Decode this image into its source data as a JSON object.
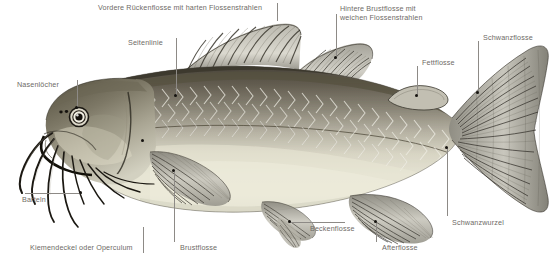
{
  "diagram": {
    "language": "de",
    "background_color": "#ffffff",
    "label_color": "#6e6a66",
    "leader_color": "#8d8a86",
    "dot_color": "#15130f"
  },
  "labels": [
    {
      "id": "vordere-rueckenflosse",
      "text": "Vordere Rückenflosse mit harten Flossenstrahlen",
      "x": 98,
      "y": 3,
      "lines": [
        {
          "type": "v",
          "x": 277,
          "y": 3,
          "len": 18
        }
      ],
      "dot": null
    },
    {
      "id": "seitenlinie",
      "text": "Seitenlinie",
      "x": 128,
      "y": 38,
      "lines": [
        {
          "type": "v",
          "x": 176,
          "y": 38,
          "len": 57
        }
      ],
      "dot": {
        "x": 175,
        "y": 95
      }
    },
    {
      "id": "nasenloecher",
      "text": "Nasenlöcher",
      "x": 17,
      "y": 80,
      "lines": [
        {
          "type": "v",
          "x": 77,
          "y": 80,
          "len": 27
        }
      ],
      "dot": {
        "x": 76,
        "y": 107
      }
    },
    {
      "id": "hintere-brustflosse",
      "text": "Hintere Brustflosse mit\nweichen Flossenstrahlen",
      "x": 340,
      "y": 4,
      "lines": [
        {
          "type": "v",
          "x": 336,
          "y": 14,
          "len": 43
        }
      ],
      "dot": {
        "x": 335,
        "y": 57
      }
    },
    {
      "id": "fettflosse",
      "text": "Fettflosse",
      "x": 422,
      "y": 58,
      "lines": [
        {
          "type": "v",
          "x": 417,
          "y": 66,
          "len": 29
        }
      ],
      "dot": {
        "x": 416,
        "y": 95
      }
    },
    {
      "id": "schwanzflosse",
      "text": "Schwanzflosse",
      "x": 483,
      "y": 33,
      "lines": [
        {
          "type": "v",
          "x": 478,
          "y": 41,
          "len": 51
        }
      ],
      "dot": {
        "x": 477,
        "y": 92
      }
    },
    {
      "id": "barteln",
      "text": "Barteln",
      "x": 22,
      "y": 195,
      "lines": [
        {
          "type": "h",
          "x": 25,
          "y": 193,
          "len": 57
        }
      ],
      "dot": {
        "x": 80,
        "y": 192
      }
    },
    {
      "id": "kiemendeckel",
      "text": "Kiemendeckel oder Operculum",
      "x": 30,
      "y": 243,
      "lines": [
        {
          "type": "v",
          "x": 143,
          "y": 227,
          "len": 26
        }
      ],
      "dot": {
        "x": 142,
        "y": 140
      }
    },
    {
      "id": "brustflosse",
      "text": "Brustflosse",
      "x": 180,
      "y": 243,
      "lines": [
        {
          "type": "v",
          "x": 174,
          "y": 172,
          "len": 70
        }
      ],
      "dot": {
        "x": 173,
        "y": 170
      }
    },
    {
      "id": "beckenflosse",
      "text": "Beckenflosse",
      "x": 310,
      "y": 224,
      "lines": [
        {
          "type": "h",
          "x": 290,
          "y": 222,
          "len": 55
        }
      ],
      "dot": {
        "x": 289,
        "y": 221
      }
    },
    {
      "id": "afterflosse",
      "text": "Afterflosse",
      "x": 382,
      "y": 243,
      "lines": [
        {
          "type": "v",
          "x": 376,
          "y": 222,
          "len": 20
        }
      ],
      "dot": {
        "x": 375,
        "y": 221
      }
    },
    {
      "id": "schwanzwurzel",
      "text": "Schwanzwurzel",
      "x": 452,
      "y": 218,
      "lines": [
        {
          "type": "v",
          "x": 447,
          "y": 148,
          "len": 68
        }
      ],
      "dot": {
        "x": 446,
        "y": 147
      }
    }
  ]
}
